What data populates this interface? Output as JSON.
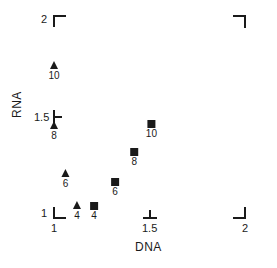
{
  "chart_data": {
    "type": "scatter",
    "title": "",
    "xlabel": "DNA",
    "ylabel": "RNA",
    "xlim": [
      1,
      2
    ],
    "ylim": [
      1,
      2
    ],
    "grid": false,
    "x_ticks": [
      "1",
      "1.5",
      "2"
    ],
    "y_ticks": [
      "1",
      "1.5",
      "2"
    ],
    "series": [
      {
        "name": "triangles",
        "marker": "triangle",
        "points": [
          {
            "label": "4",
            "x": 1.12,
            "y": 1.05
          },
          {
            "label": "6",
            "x": 1.06,
            "y": 1.21
          },
          {
            "label": "8",
            "x": 1.0,
            "y": 1.45
          },
          {
            "label": "10",
            "x": 1.0,
            "y": 1.75
          }
        ]
      },
      {
        "name": "squares",
        "marker": "square",
        "points": [
          {
            "label": "4",
            "x": 1.21,
            "y": 1.05
          },
          {
            "label": "6",
            "x": 1.32,
            "y": 1.17
          },
          {
            "label": "8",
            "x": 1.42,
            "y": 1.32
          },
          {
            "label": "10",
            "x": 1.51,
            "y": 1.46
          }
        ]
      }
    ]
  }
}
